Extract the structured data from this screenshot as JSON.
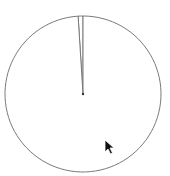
{
  "chart_data": {
    "type": "pie",
    "title": "",
    "start_angle": "top",
    "direction": "counterclockwise",
    "slices": [
      {
        "label": "",
        "value": 1
      },
      {
        "label": "",
        "value": 99
      }
    ],
    "legend": "none",
    "edge_color": "#7a7a7a",
    "fill_color": "#ffffff"
  },
  "cursor": {
    "icon": "mouse-pointer-icon"
  }
}
